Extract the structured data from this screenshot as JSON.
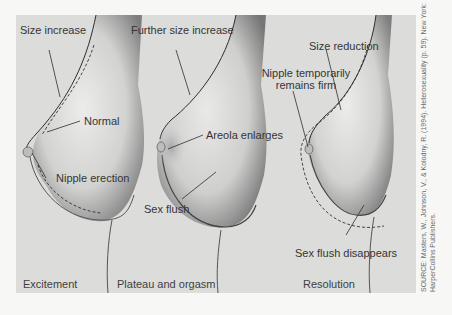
{
  "figure": {
    "stages": [
      {
        "name": "Excitement",
        "labels": [
          "Size increase",
          "Normal",
          "Nipple erection"
        ]
      },
      {
        "name": "Plateau and orgasm",
        "labels": [
          "Further size increase",
          "Areola enlarges",
          "Sex flush"
        ]
      },
      {
        "name": "Resolution",
        "labels": [
          "Size reduction",
          "Nipple temporarily remains firm",
          "Sex flush disappears"
        ]
      }
    ],
    "labels": {
      "size_increase": "Size increase",
      "normal": "Normal",
      "nipple_erection": "Nipple erection",
      "further_size_increase": "Further size increase",
      "areola_enlarges": "Areola enlarges",
      "sex_flush": "Sex flush",
      "size_reduction": "Size reduction",
      "nipple_firm_line1": "Nipple temporarily",
      "nipple_firm_line2": "remains firm",
      "sex_flush_disappears": "Sex flush disappears"
    },
    "stage_names": {
      "excitement": "Excitement",
      "plateau": "Plateau and orgasm",
      "resolution": "Resolution"
    },
    "source": {
      "line1": "SOURCE: Masters, W., Johnson, V., & Kolodny, R. (1994). Heterosexuality (p. 59). New York:",
      "line2": "HarperCollins Publishers."
    },
    "colors": {
      "background": "#dcdcdb",
      "page": "#f7f7f6",
      "skin_light": "#e6e6e5",
      "skin_shadow": "#8a8a8a",
      "line": "#2e2e2e"
    }
  }
}
